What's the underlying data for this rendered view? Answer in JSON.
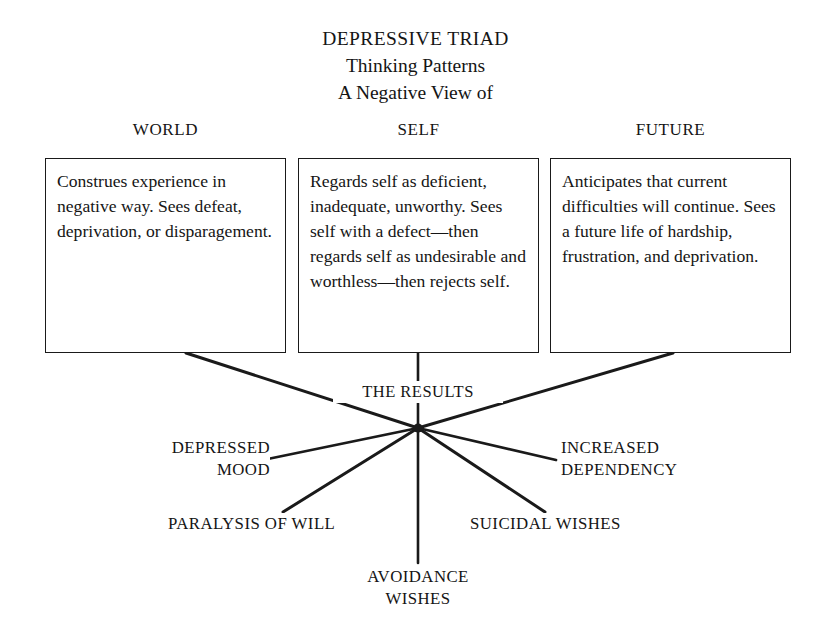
{
  "title": {
    "line1": "DEPRESSIVE TRIAD",
    "line2": "Thinking Patterns",
    "line3": "A Negative View of"
  },
  "columns": [
    {
      "header": "WORLD",
      "text": "Construes experience in negative way. Sees defeat, deprivation, or disparagement."
    },
    {
      "header": "SELF",
      "text": "Regards self as deficient, inadequate, unworthy. Sees self with a defect—then regards self as undesirable and worthless—then rejects self."
    },
    {
      "header": "FUTURE",
      "text": "Anticipates that current difficulties will continue. Sees a future life of hardship, frustration, and deprivation."
    }
  ],
  "hub": {
    "label": "THE RESULTS"
  },
  "outcomes": [
    {
      "label": "DEPRESSED\nMOOD"
    },
    {
      "label": "INCREASED\nDEPENDENCY"
    },
    {
      "label": "PARALYSIS OF WILL"
    },
    {
      "label": "SUICIDAL WISHES"
    },
    {
      "label": "AVOIDANCE\nWISHES"
    }
  ],
  "style": {
    "ink": "#1a1a1a",
    "paper": "#ffffff"
  }
}
